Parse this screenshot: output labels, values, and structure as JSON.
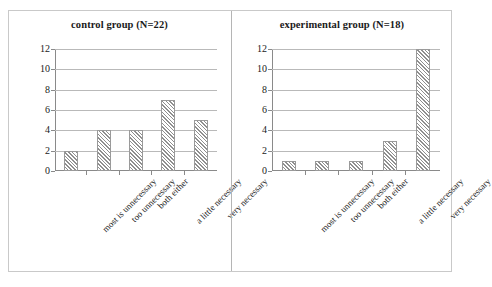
{
  "chart_data": [
    {
      "type": "bar",
      "title": "control group (N=22)",
      "categories": [
        "most is unnecessary",
        "too unnecessary",
        "both either",
        "a little necessary",
        "very necessary"
      ],
      "values": [
        2,
        4,
        4,
        7,
        5
      ],
      "xlabel": "",
      "ylabel": "",
      "ylim": [
        0,
        12
      ],
      "yticks": [
        0,
        2,
        4,
        6,
        8,
        10,
        12
      ],
      "ytick_labels": [
        "0",
        "2",
        "4",
        "6",
        "8",
        "10",
        "12"
      ],
      "grid": true,
      "legend": false,
      "bar_fill": "diagonal-hatch",
      "colors": {
        "bar_line": "#8f8f8f",
        "grid": "#b9b9b9",
        "axis": "#8a8a8a",
        "text": "#1a1a1a"
      }
    },
    {
      "type": "bar",
      "title": "experimental group (N=18)",
      "categories": [
        "most is unnecessary",
        "too unnecessary",
        "both either",
        "a little necessary",
        "very necessary"
      ],
      "values": [
        1,
        1,
        1,
        3,
        12
      ],
      "xlabel": "",
      "ylabel": "",
      "ylim": [
        0,
        12
      ],
      "yticks": [
        0,
        2,
        4,
        6,
        8,
        10,
        12
      ],
      "ytick_labels": [
        "0",
        "2",
        "4",
        "6",
        "8",
        "10",
        "12"
      ],
      "grid": true,
      "legend": false,
      "bar_fill": "diagonal-hatch",
      "colors": {
        "bar_line": "#8f8f8f",
        "grid": "#b9b9b9",
        "axis": "#8a8a8a",
        "text": "#1a1a1a"
      }
    }
  ]
}
